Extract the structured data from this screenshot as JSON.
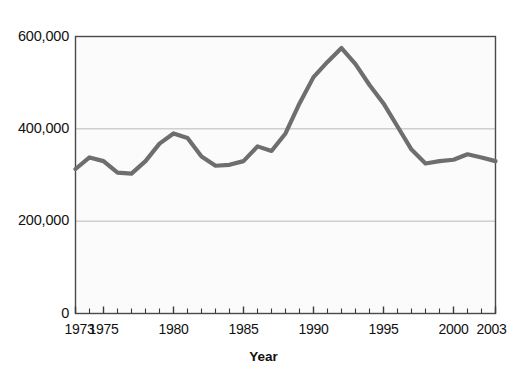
{
  "chart_data": {
    "type": "line",
    "title": "",
    "xlabel": "Year",
    "ylabel": "",
    "x": [
      1973,
      1974,
      1975,
      1976,
      1977,
      1978,
      1979,
      1980,
      1981,
      1982,
      1983,
      1984,
      1985,
      1986,
      1987,
      1988,
      1989,
      1990,
      1991,
      1992,
      1993,
      1994,
      1995,
      1996,
      1997,
      1998,
      1999,
      2000,
      2001,
      2002,
      2003
    ],
    "values": [
      313000,
      338000,
      330000,
      305000,
      303000,
      330000,
      368000,
      390000,
      380000,
      340000,
      320000,
      322000,
      330000,
      362000,
      352000,
      390000,
      455000,
      512000,
      545000,
      575000,
      540000,
      495000,
      455000,
      405000,
      355000,
      325000,
      330000,
      333000,
      345000,
      338000,
      330000
    ],
    "series": [
      {
        "name": "value",
        "values": [
          313000,
          338000,
          330000,
          305000,
          303000,
          330000,
          368000,
          390000,
          380000,
          340000,
          320000,
          322000,
          330000,
          362000,
          352000,
          390000,
          455000,
          512000,
          545000,
          575000,
          540000,
          495000,
          455000,
          405000,
          355000,
          325000,
          330000,
          333000,
          345000,
          338000,
          330000
        ]
      }
    ],
    "xlim": [
      1973,
      2003
    ],
    "ylim": [
      0,
      600000
    ],
    "ytick_values": [
      0,
      200000,
      400000,
      600000
    ],
    "ytick_labels": [
      "0",
      "200,000",
      "400,000",
      "600,000"
    ],
    "xtick_labels": [
      "1973",
      "1975",
      "1980",
      "1985",
      "1990",
      "1995",
      "2000",
      "2003"
    ],
    "xtick_values": [
      1973,
      1975,
      1980,
      1985,
      1990,
      1995,
      2000,
      2003
    ],
    "minor_xticks_every": 1,
    "grid": "horizontal-only",
    "legend": "none",
    "line_color": "#6e6e6e",
    "line_width": 4.2,
    "plot_bg": "#fbfbfb",
    "frame_color": "#4a4a4a",
    "grid_color": "#b9b9b9"
  }
}
